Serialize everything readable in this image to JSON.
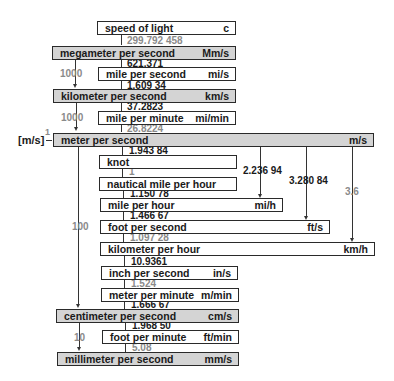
{
  "diagram": {
    "units": [
      {
        "name": "speed of light",
        "symbol": "c",
        "base": false
      },
      {
        "name": "megameter per second",
        "symbol": "Mm/s",
        "base": true
      },
      {
        "name": "mile per second",
        "symbol": "mi/s",
        "base": false
      },
      {
        "name": "kilometer per second",
        "symbol": "km/s",
        "base": true
      },
      {
        "name": "mile per minute",
        "symbol": "mi/min",
        "base": false
      },
      {
        "name": "meter per second",
        "symbol": "m/s",
        "base": true
      },
      {
        "name": "knot",
        "symbol": "",
        "base": false
      },
      {
        "name": "nautical mile per hour",
        "symbol": "",
        "base": false
      },
      {
        "name": "mile per hour",
        "symbol": "mi/h",
        "base": false
      },
      {
        "name": "foot per second",
        "symbol": "ft/s",
        "base": false
      },
      {
        "name": "kilometer per hour",
        "symbol": "km/h",
        "base": false
      },
      {
        "name": "inch per second",
        "symbol": "in/s",
        "base": false
      },
      {
        "name": "meter per minute",
        "symbol": "m/min",
        "base": false
      },
      {
        "name": "centimeter per second",
        "symbol": "cm/s",
        "base": true
      },
      {
        "name": "foot per minute",
        "symbol": "ft/min",
        "base": false
      },
      {
        "name": "millimeter per second",
        "symbol": "mm/s",
        "base": true
      }
    ],
    "chain_factors": [
      {
        "value": "299.792 458",
        "style": "light"
      },
      {
        "value": "621.371",
        "style": "dark"
      },
      {
        "value": "1.609 34",
        "style": "dark"
      },
      {
        "value": "37.2823",
        "style": "dark"
      },
      {
        "value": "26.8224",
        "style": "light"
      },
      {
        "value": "1.943 84",
        "style": "dark"
      },
      {
        "value": "1",
        "style": "light"
      },
      {
        "value": "1.150 78",
        "style": "dark"
      },
      {
        "value": "1.466 67",
        "style": "dark"
      },
      {
        "value": "1.097 28",
        "style": "light"
      },
      {
        "value": "10.9361",
        "style": "dark"
      },
      {
        "value": "1.524",
        "style": "light"
      },
      {
        "value": "1.666 67",
        "style": "dark"
      },
      {
        "value": "1.968 50",
        "style": "dark"
      },
      {
        "value": "5.08",
        "style": "light"
      }
    ],
    "side_factors": {
      "mm_to_km": "1000",
      "km_to_m": "1000",
      "m_to_cm": "100",
      "cm_to_mm": "10"
    },
    "branch_factors": {
      "m_s_to_mi_h": "2.236 94",
      "m_s_to_ft_s": "3.280 84",
      "m_s_to_km_h": "3.6"
    },
    "si_unit": {
      "label": "m/s",
      "factor": "1"
    }
  }
}
